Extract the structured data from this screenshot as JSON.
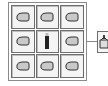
{
  "crafting_grid": {
    "rows": 3,
    "cols": 3,
    "slots": [
      {
        "item": "hand-icon"
      },
      {
        "item": "hand-icon"
      },
      {
        "item": "hand-icon"
      },
      {
        "item": "hand-icon"
      },
      {
        "item": "stick-icon"
      },
      {
        "item": "hand-icon"
      },
      {
        "item": "hand-icon"
      },
      {
        "item": "hand-icon"
      },
      {
        "item": "hand-icon"
      }
    ]
  },
  "output": {
    "item": "bucket-icon"
  },
  "colors": {
    "border": "#6e6e6e",
    "icon": "#3a3a3a",
    "background": "#ffffff"
  }
}
